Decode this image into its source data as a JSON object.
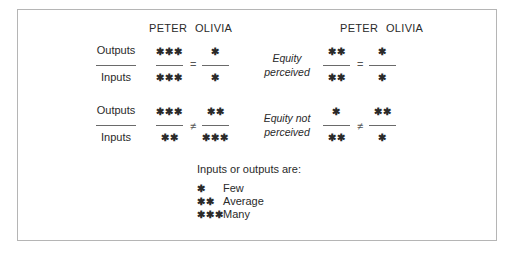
{
  "diagram": {
    "left_headers": {
      "person_a": "PETER",
      "person_b": "OLIVIA"
    },
    "right_headers": {
      "person_a": "PETER",
      "person_b": "OLIVIA"
    },
    "row_labels": {
      "numerator": "Outputs",
      "denominator": "Inputs"
    },
    "rows": [
      {
        "left": {
          "peter": {
            "outputs": "✱✱✱",
            "inputs": "✱✱✱"
          },
          "operator": "=",
          "olivia": {
            "outputs": "✱",
            "inputs": "✱"
          }
        },
        "caption": "Equity perceived",
        "right": {
          "peter": {
            "outputs": "✱✱",
            "inputs": "✱✱"
          },
          "operator": "=",
          "olivia": {
            "outputs": "✱",
            "inputs": "✱"
          }
        }
      },
      {
        "left": {
          "peter": {
            "outputs": "✱✱✱",
            "inputs": "✱✱"
          },
          "operator": "≠",
          "olivia": {
            "outputs": "✱✱",
            "inputs": "✱✱✱"
          }
        },
        "caption": "Equity not perceived",
        "right": {
          "peter": {
            "outputs": "✱",
            "inputs": "✱✱"
          },
          "operator": "≠",
          "olivia": {
            "outputs": "✱✱",
            "inputs": "✱"
          }
        }
      }
    ],
    "legend": {
      "title": "Inputs or outputs are:",
      "items": [
        {
          "symbol": "✱",
          "label": "Few"
        },
        {
          "symbol": "✱✱",
          "label": "Average"
        },
        {
          "symbol": "✱✱✱",
          "label": "Many"
        }
      ]
    }
  }
}
